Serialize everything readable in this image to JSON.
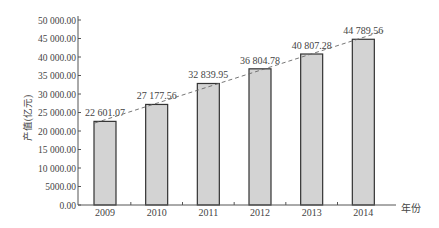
{
  "chart_data": {
    "type": "bar",
    "title": "",
    "xlabel": "年份",
    "ylabel": "产值(亿元)",
    "categories": [
      "2009",
      "2010",
      "2011",
      "2012",
      "2013",
      "2014"
    ],
    "values": [
      22601.07,
      27177.56,
      32839.95,
      36804.78,
      40807.28,
      44789.56
    ],
    "value_labels": [
      "22 601.07",
      "27 177.56",
      "32 839.95",
      "36 804.78",
      "40 807.28",
      "44 789.56"
    ],
    "ylim": [
      0,
      50000
    ],
    "yticks": [
      0,
      5000,
      10000,
      15000,
      20000,
      25000,
      30000,
      35000,
      40000,
      45000,
      50000
    ],
    "ytick_labels": [
      "0.00",
      "5000.00",
      "10 000.00",
      "15 000.00",
      "20 000.00",
      "25 000.00",
      "30 000.00",
      "35 000.00",
      "40 000.00",
      "45 000.00",
      "50 000.00"
    ],
    "trendline": {
      "style": "dashed",
      "type": "linear",
      "through": "bar tops"
    },
    "grid": false,
    "legend": null,
    "colors": {
      "bar_fill": "#d3d3d3",
      "bar_stroke": "#333333",
      "axis": "#555555",
      "trend": "#666666"
    }
  }
}
